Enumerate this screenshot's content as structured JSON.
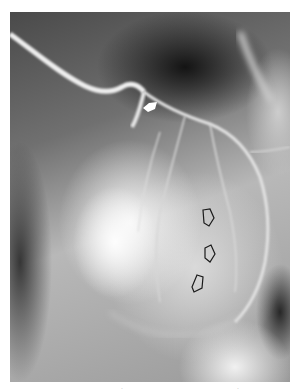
{
  "figure": {
    "type": "coronary angiogram radiograph",
    "tone": "grayscale",
    "colors": {
      "background": "#ffffff",
      "dark_field": "#141414",
      "bright_field": "#f5f5f5",
      "vessel": "#e8e8e8",
      "arrow_outline": "#1a1a1a",
      "solid_arrow_fill": "#ffffff"
    }
  },
  "annotations": {
    "solid_arrow": {
      "icon": "solid-arrow-icon",
      "direction": "left",
      "color": "white"
    },
    "open_arrows": [
      {
        "icon": "open-arrow-icon",
        "direction": "left"
      },
      {
        "icon": "open-arrow-icon",
        "direction": "left"
      },
      {
        "icon": "open-arrow-icon",
        "direction": "left"
      }
    ]
  },
  "bottom_marks": [
    ".",
    "."
  ]
}
